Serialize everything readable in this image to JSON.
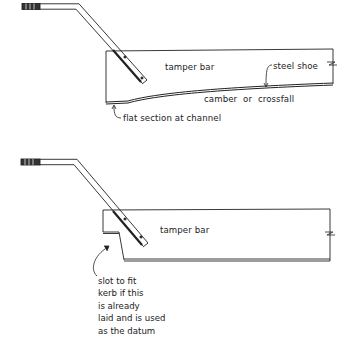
{
  "diagram_top": {
    "title": "tamper bar with steel shoe (camber profile)",
    "labels": {
      "bar": "tamper bar",
      "shoe": "steel shoe",
      "camber": "camber or crossfall",
      "flat": "flat section at channel"
    }
  },
  "diagram_bottom": {
    "title": "tamper bar with kerb slot",
    "labels": {
      "bar": "tamper bar",
      "note_lines": [
        "slot to fit",
        "kerb if this",
        "is already",
        "laid and is used",
        "as the datum"
      ]
    }
  },
  "colors": {
    "ink": "#222222",
    "background": "#ffffff"
  }
}
